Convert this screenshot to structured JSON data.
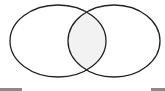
{
  "diagram": {
    "type": "venn",
    "set_count": 2,
    "background_color": "#ffffff",
    "stroke_color": "#222222",
    "intersection_fill": "#f2f2f2",
    "sets": [
      {
        "name": "set-a",
        "label": "",
        "cx": 58,
        "cy": 41,
        "rx": 48,
        "ry": 36
      },
      {
        "name": "set-b",
        "label": "",
        "cx": 114,
        "cy": 41,
        "rx": 46,
        "ry": 36
      }
    ],
    "intersection_label": "",
    "corner_bar_color": "#8a8a8a"
  }
}
